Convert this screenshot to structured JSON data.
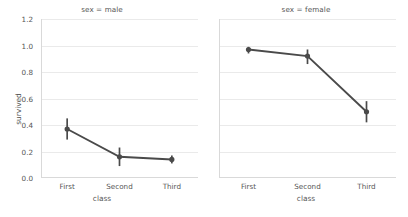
{
  "chart_data": {
    "type": "line",
    "title": "",
    "xlabel": "class",
    "ylabel": "survived",
    "categories": [
      "First",
      "Second",
      "Third"
    ],
    "ylim": [
      0.0,
      1.2
    ],
    "yticks": [
      0.0,
      0.2,
      0.4,
      0.6,
      0.8,
      1.0,
      1.2
    ],
    "ytick_labels": [
      "0.0",
      "0.2",
      "0.4",
      "0.6",
      "0.8",
      "1.0",
      "1.2"
    ],
    "grid": true,
    "legend": "none",
    "facet_variable": "sex",
    "facets": [
      {
        "title": "sex = male",
        "series": [
          {
            "name": "male",
            "values": [
              0.37,
              0.16,
              0.14
            ],
            "ci_low": [
              0.29,
              0.09,
              0.11
            ],
            "ci_high": [
              0.45,
              0.23,
              0.17
            ]
          }
        ]
      },
      {
        "title": "sex = female",
        "series": [
          {
            "name": "female",
            "values": [
              0.97,
              0.92,
              0.5
            ],
            "ci_low": [
              0.94,
              0.86,
              0.42
            ],
            "ci_high": [
              0.99,
              0.97,
              0.58
            ]
          }
        ]
      }
    ],
    "colors": {
      "marker": "#4a4a4a",
      "line": "#4a4a4a",
      "grid": "#eaeaea",
      "spine": "#d9d9d9",
      "text": "#555555",
      "background": "#ffffff"
    }
  }
}
